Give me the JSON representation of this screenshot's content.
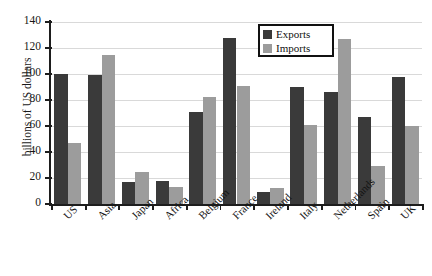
{
  "chart_data": {
    "type": "bar",
    "title": "",
    "xlabel": "",
    "ylabel": "billions of US dollars",
    "ylim": [
      0,
      140
    ],
    "yticks": [
      0,
      20,
      40,
      60,
      80,
      100,
      120,
      140
    ],
    "grid": true,
    "legend_position": "top-right",
    "categories": [
      "US",
      "Asia",
      "Japan",
      "Africa",
      "Belgium",
      "France",
      "Ireland",
      "Italy",
      "Netherlands",
      "Spain",
      "UK"
    ],
    "series": [
      {
        "name": "Exports",
        "color": "#3a3a3a",
        "values": [
          100,
          99,
          17,
          18,
          71,
          128,
          9,
          90,
          86,
          67,
          98
        ]
      },
      {
        "name": "Imports",
        "color": "#9c9c9c",
        "values": [
          47,
          115,
          25,
          13,
          82,
          91,
          12,
          61,
          127,
          29,
          60
        ]
      }
    ]
  },
  "legend": {
    "items": [
      {
        "label": "Exports",
        "color": "#3a3a3a"
      },
      {
        "label": "Imports",
        "color": "#9c9c9c"
      }
    ]
  },
  "axis": {
    "y_title": "billions of US dollars"
  },
  "page": {
    "cropped_title": ""
  }
}
